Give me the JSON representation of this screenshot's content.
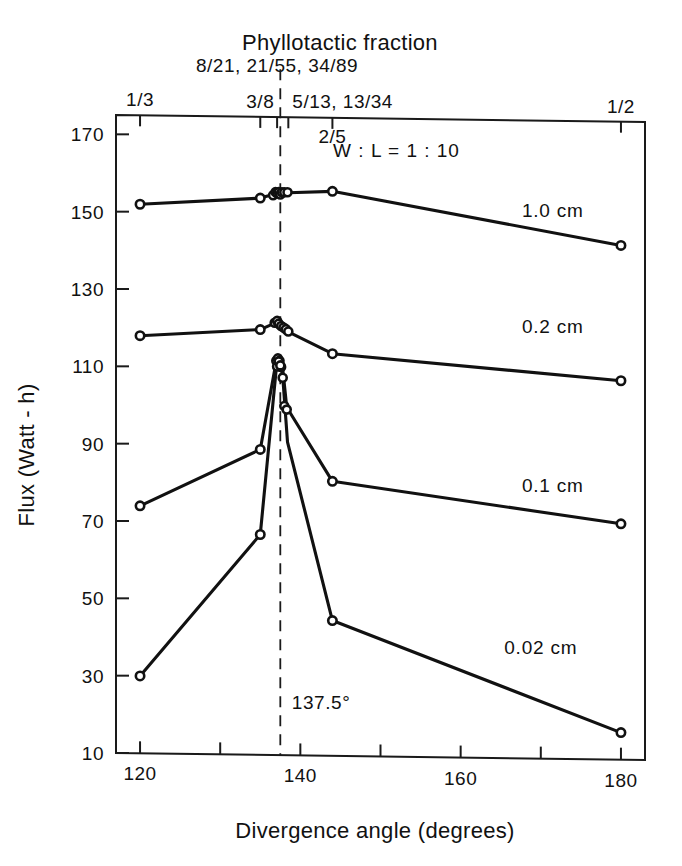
{
  "chart_data": {
    "type": "line",
    "title": "",
    "xlabel": "Divergence angle (degrees)",
    "ylabel": "Flux (Watt - h)",
    "top_axis_label": "Phyllotactic fraction",
    "xlim": [
      117,
      183
    ],
    "ylim": [
      10,
      175
    ],
    "grid": false,
    "legend_position": "inline-right",
    "annotations": [
      {
        "id": "ratio",
        "text": "W : L = 1 : 10",
        "x": 152,
        "y": 165
      },
      {
        "id": "golden-angle",
        "text": "137.5°",
        "x": 138.3,
        "y": 22
      }
    ],
    "reference_line": {
      "x": 137.5,
      "style": "dashed",
      "label": "137.5°"
    },
    "x_ticks_major": [
      120,
      140,
      160,
      180
    ],
    "x_ticks_minor": [
      130,
      150,
      170
    ],
    "y_ticks": [
      10,
      30,
      50,
      70,
      90,
      110,
      130,
      150,
      170
    ],
    "top_axis_ticks": [
      {
        "value": 120.0,
        "label": "1/3"
      },
      {
        "value": 135.0,
        "label": "3/8"
      },
      {
        "value": 137.1,
        "label": "8/21, 21/55, 34/89"
      },
      {
        "value": 138.5,
        "label": "5/13, 13/34"
      },
      {
        "value": 144.0,
        "label": "2/5"
      },
      {
        "value": 180.0,
        "label": "1/2"
      }
    ],
    "series": [
      {
        "name": "1.0 cm",
        "label": "1.0 cm",
        "label_pos": {
          "x": 171.5,
          "y": 150
        },
        "x": [
          120.0,
          135.0,
          136.6,
          137.0,
          137.3,
          137.5,
          137.8,
          138.1,
          138.5,
          144.0,
          180.0
        ],
        "values": [
          152,
          154,
          155,
          155.5,
          155.5,
          155.2,
          155.5,
          155.5,
          155.5,
          156,
          143
        ]
      },
      {
        "name": "0.2 cm",
        "label": "0.2 cm",
        "label_pos": {
          "x": 171.5,
          "y": 120
        },
        "x": [
          120.0,
          135.0,
          136.6,
          137.0,
          137.3,
          137.5,
          137.8,
          138.1,
          138.5,
          144.0,
          180.0
        ],
        "values": [
          118,
          120,
          121.5,
          122,
          121.5,
          121,
          120.5,
          120,
          119.5,
          114,
          108
        ]
      },
      {
        "name": "0.1 cm",
        "label": "0.1 cm",
        "label_pos": {
          "x": 171.5,
          "y": 79
        },
        "x": [
          120.0,
          135.0,
          137.0,
          137.3,
          137.5,
          137.8,
          138.3,
          144.0,
          180.0
        ],
        "values": [
          74,
          89,
          112,
          112.5,
          112,
          110,
          100,
          81,
          71
        ]
      },
      {
        "name": "0.02 cm",
        "label": "0.02 cm",
        "label_pos": {
          "x": 170.0,
          "y": 37
        },
        "x": [
          120.0,
          135.0,
          137.0,
          137.3,
          137.5,
          137.8,
          138.4,
          144.0,
          180.0
        ],
        "values": [
          30,
          67,
          110,
          112,
          111,
          108,
          91,
          45,
          17
        ]
      }
    ],
    "marker_clusters": [
      {
        "series": "1.0 cm",
        "points": [
          [
            136.6,
            154.8
          ],
          [
            136.9,
            155.6
          ],
          [
            137.1,
            155.3
          ],
          [
            137.3,
            155.6
          ],
          [
            137.5,
            155.0
          ],
          [
            137.7,
            155.6
          ],
          [
            138.0,
            155.6
          ],
          [
            138.4,
            155.6
          ]
        ]
      },
      {
        "series": "0.2 cm",
        "points": [
          [
            136.8,
            121.8
          ],
          [
            137.1,
            122.3
          ],
          [
            137.3,
            121.6
          ],
          [
            137.6,
            121.0
          ],
          [
            137.9,
            120.6
          ],
          [
            138.2,
            120.2
          ],
          [
            138.5,
            119.6
          ]
        ]
      },
      {
        "series": "0.1 cm",
        "points": [
          [
            137.0,
            112.0
          ],
          [
            137.2,
            112.6
          ],
          [
            137.4,
            112.0
          ],
          [
            137.6,
            110.4
          ],
          [
            138.0,
            100.3
          ],
          [
            138.3,
            99.4
          ]
        ]
      },
      {
        "series": "0.02 cm",
        "points": [
          [
            137.1,
            110.5
          ],
          [
            137.3,
            111.8
          ],
          [
            137.5,
            110.8
          ],
          [
            137.8,
            107.6
          ]
        ]
      }
    ]
  }
}
